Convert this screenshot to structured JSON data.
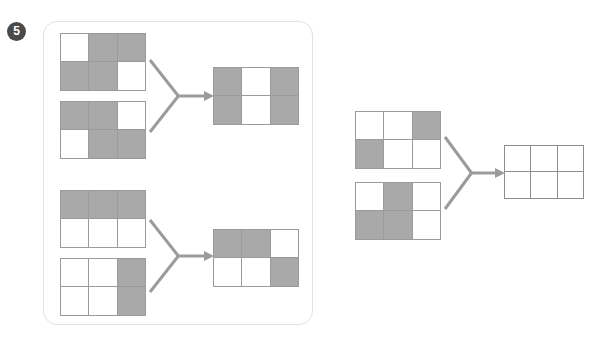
{
  "page": {
    "background": "#ffffff",
    "width": 603,
    "height": 346
  },
  "question": {
    "number": "5",
    "badge_name": "question-number-badge"
  },
  "colors": {
    "shaded_cell": "#a9a9a9",
    "empty_cell": "#ffffff",
    "cell_border": "#9b9b9b",
    "answer_cell_border": "#8e8e8e",
    "panel_border": "#e2e2e2",
    "arrow": "#9b9b9b",
    "badge_fill": "#4a4a4a",
    "badge_text": "#ffffff"
  },
  "puzzle": {
    "type": "grid-overlay-combination",
    "rows": 2,
    "cols": 3,
    "groups": [
      {
        "id": "group-1",
        "inputs": [
          {
            "id": "grid-1",
            "label": "input-grid-1",
            "cells": [
              [
                "off",
                "on",
                "on"
              ],
              [
                "on",
                "on",
                "off"
              ]
            ]
          },
          {
            "id": "grid-2",
            "label": "input-grid-2",
            "cells": [
              [
                "on",
                "on",
                "off"
              ],
              [
                "off",
                "on",
                "on"
              ]
            ]
          }
        ],
        "output": {
          "id": "grid-3",
          "label": "output-grid-1",
          "cells": [
            [
              "on",
              "off",
              "on"
            ],
            [
              "on",
              "off",
              "on"
            ]
          ]
        }
      },
      {
        "id": "group-2",
        "inputs": [
          {
            "id": "grid-4",
            "label": "input-grid-3",
            "cells": [
              [
                "on",
                "on",
                "on"
              ],
              [
                "off",
                "off",
                "off"
              ]
            ]
          },
          {
            "id": "grid-5",
            "label": "input-grid-4",
            "cells": [
              [
                "off",
                "off",
                "on"
              ],
              [
                "off",
                "off",
                "on"
              ]
            ]
          }
        ],
        "output": {
          "id": "grid-6",
          "label": "output-grid-2",
          "cells": [
            [
              "on",
              "on",
              "off"
            ],
            [
              "off",
              "off",
              "on"
            ]
          ]
        }
      },
      {
        "id": "group-3",
        "inputs": [
          {
            "id": "grid-7",
            "label": "input-grid-5",
            "cells": [
              [
                "off",
                "off",
                "on"
              ],
              [
                "on",
                "off",
                "off"
              ]
            ]
          },
          {
            "id": "grid-8",
            "label": "input-grid-6",
            "cells": [
              [
                "off",
                "on",
                "off"
              ],
              [
                "on",
                "on",
                "off"
              ]
            ]
          }
        ],
        "output": {
          "id": "grid-9",
          "label": "answer-grid",
          "is_answer_blank": true,
          "cells": [
            [
              "off",
              "off",
              "off"
            ],
            [
              "off",
              "off",
              "off"
            ]
          ]
        }
      }
    ],
    "arrows": [
      {
        "id": "arrow-1",
        "label": "merge-arrow-1"
      },
      {
        "id": "arrow-2",
        "label": "merge-arrow-2"
      },
      {
        "id": "arrow-3",
        "label": "merge-arrow-3"
      }
    ]
  },
  "layout": {
    "panel": {
      "x": 43,
      "y": 21,
      "w": 270,
      "h": 304
    },
    "grids": {
      "grid-1": {
        "x": 60,
        "y": 33,
        "w": 86,
        "h": 57
      },
      "grid-2": {
        "x": 60,
        "y": 101,
        "w": 86,
        "h": 57
      },
      "grid-3": {
        "x": 213,
        "y": 67,
        "w": 86,
        "h": 57
      },
      "grid-4": {
        "x": 60,
        "y": 190,
        "w": 86,
        "h": 57
      },
      "grid-5": {
        "x": 60,
        "y": 258,
        "w": 86,
        "h": 57
      },
      "grid-6": {
        "x": 213,
        "y": 229,
        "w": 86,
        "h": 57
      },
      "grid-7": {
        "x": 355,
        "y": 111,
        "w": 86,
        "h": 57
      },
      "grid-8": {
        "x": 355,
        "y": 182,
        "w": 86,
        "h": 57
      },
      "grid-9": {
        "x": 504,
        "y": 145,
        "w": 80,
        "h": 53
      }
    },
    "arrows": {
      "arrow-1": {
        "x": 148,
        "y": 58,
        "w": 66,
        "h": 76
      },
      "arrow-2": {
        "x": 148,
        "y": 218,
        "w": 66,
        "h": 76
      },
      "arrow-3": {
        "x": 443,
        "y": 135,
        "w": 62,
        "h": 76
      }
    }
  }
}
